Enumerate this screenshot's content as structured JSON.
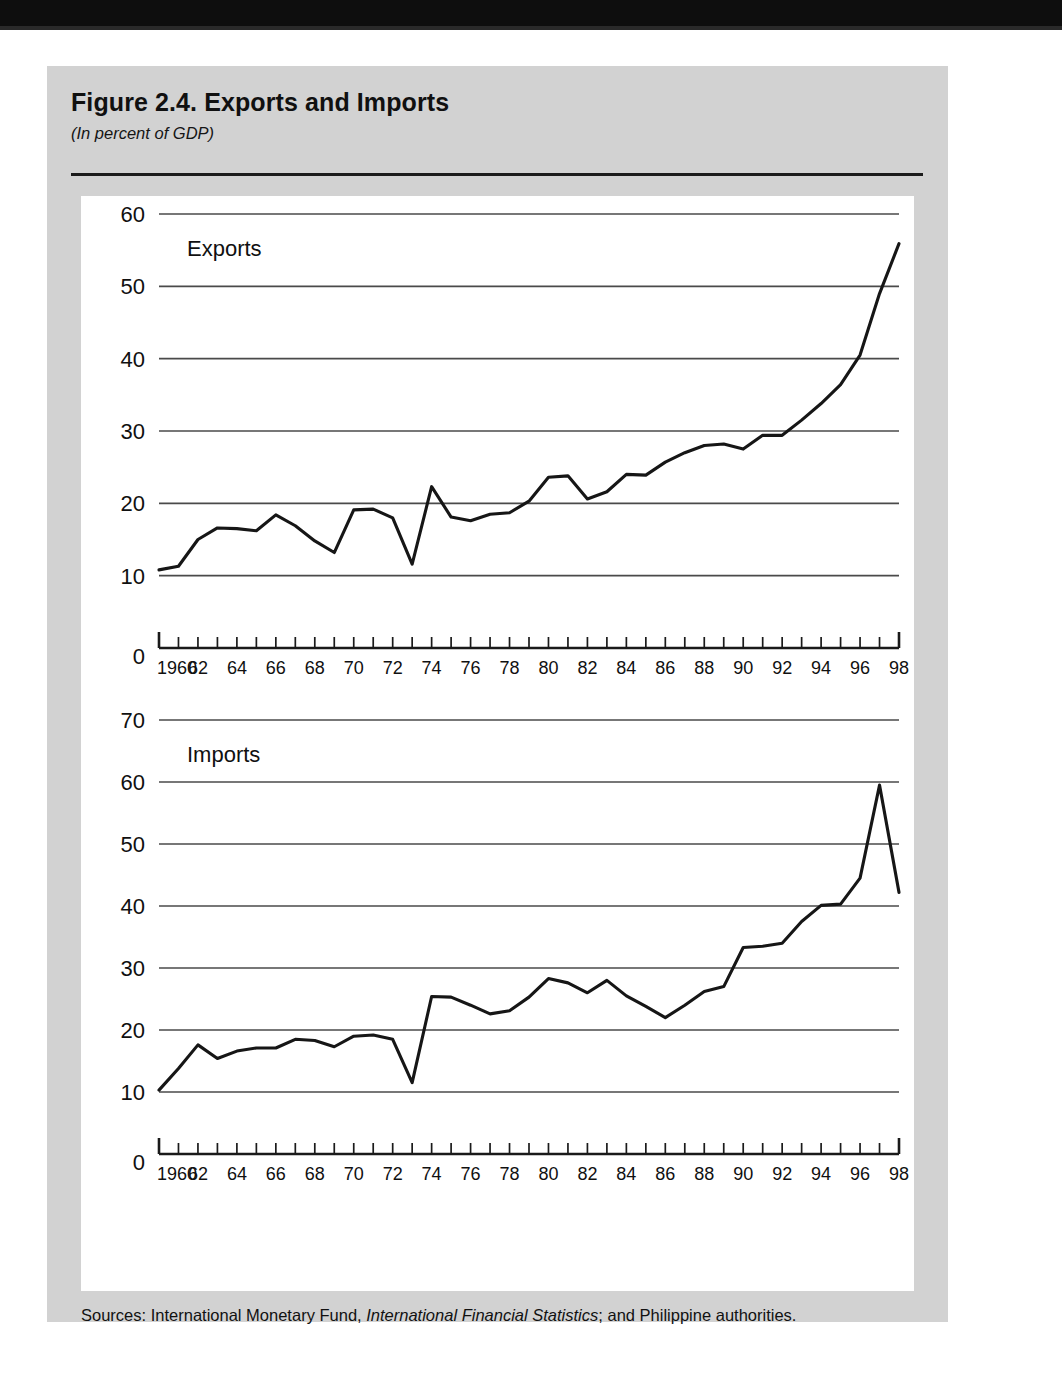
{
  "figure": {
    "title": "Figure 2.4.  Exports and Imports",
    "subtitle": "(In percent of GDP)",
    "source_prefix": "Sources:  International Monetary Fund, ",
    "source_italic": "International Financial Statistics",
    "source_suffix": "; and Philippine authorities."
  },
  "colors": {
    "page_background": "#ffffff",
    "panel_background": "#d2d2d2",
    "plot_background": "#ffffff",
    "line": "#161616",
    "gridline": "#4a4a4a",
    "axis": "#1a1a1a",
    "scan_band": "#0e0e0e"
  },
  "chart_data": [
    {
      "type": "line",
      "title": "Exports",
      "xlabel": "",
      "ylabel": "",
      "ylim": [
        0,
        60
      ],
      "yticks": [
        0,
        10,
        20,
        30,
        40,
        50,
        60
      ],
      "gridlines": [
        10,
        20,
        30,
        40,
        50,
        60
      ],
      "grid": true,
      "legend": "none",
      "xlim": [
        1960,
        1998
      ],
      "xticks": [
        1960,
        1961,
        1962,
        1963,
        1964,
        1965,
        1966,
        1967,
        1968,
        1969,
        1970,
        1971,
        1972,
        1973,
        1974,
        1975,
        1976,
        1977,
        1978,
        1979,
        1980,
        1981,
        1982,
        1983,
        1984,
        1985,
        1986,
        1987,
        1988,
        1989,
        1990,
        1991,
        1992,
        1993,
        1994,
        1995,
        1996,
        1997,
        1998
      ],
      "xticklabels": [
        "1960",
        "62",
        "64",
        "66",
        "68",
        "70",
        "72",
        "74",
        "76",
        "78",
        "80",
        "82",
        "84",
        "86",
        "88",
        "90",
        "92",
        "94",
        "96",
        "98"
      ],
      "x": [
        1960,
        1961,
        1962,
        1963,
        1964,
        1965,
        1966,
        1967,
        1968,
        1969,
        1970,
        1971,
        1972,
        1973,
        1974,
        1975,
        1976,
        1977,
        1978,
        1979,
        1980,
        1981,
        1982,
        1983,
        1984,
        1985,
        1986,
        1987,
        1988,
        1989,
        1990,
        1991,
        1992,
        1993,
        1994,
        1995,
        1996,
        1997,
        1998
      ],
      "values": [
        10.8,
        11.3,
        15.0,
        16.6,
        16.5,
        16.2,
        18.4,
        16.9,
        14.8,
        13.2,
        19.1,
        19.2,
        18.0,
        11.6,
        22.3,
        18.1,
        17.6,
        18.5,
        18.7,
        20.3,
        23.6,
        23.8,
        20.6,
        21.6,
        24.0,
        23.9,
        25.7,
        27.0,
        28.0,
        28.2,
        27.5,
        29.4,
        29.4,
        31.5,
        33.8,
        36.4,
        40.5,
        49.0,
        55.9
      ]
    },
    {
      "type": "line",
      "title": "Imports",
      "xlabel": "",
      "ylabel": "",
      "ylim": [
        0,
        70
      ],
      "yticks": [
        0,
        10,
        20,
        30,
        40,
        50,
        60,
        70
      ],
      "gridlines": [
        10,
        20,
        30,
        40,
        50,
        60,
        70
      ],
      "grid": true,
      "legend": "none",
      "xlim": [
        1960,
        1998
      ],
      "xticks": [
        1960,
        1961,
        1962,
        1963,
        1964,
        1965,
        1966,
        1967,
        1968,
        1969,
        1970,
        1971,
        1972,
        1973,
        1974,
        1975,
        1976,
        1977,
        1978,
        1979,
        1980,
        1981,
        1982,
        1983,
        1984,
        1985,
        1986,
        1987,
        1988,
        1989,
        1990,
        1991,
        1992,
        1993,
        1994,
        1995,
        1996,
        1997,
        1998
      ],
      "xticklabels": [
        "1960",
        "62",
        "64",
        "66",
        "68",
        "70",
        "72",
        "74",
        "76",
        "78",
        "80",
        "82",
        "84",
        "86",
        "88",
        "90",
        "92",
        "94",
        "96",
        "98"
      ],
      "x": [
        1960,
        1961,
        1962,
        1963,
        1964,
        1965,
        1966,
        1967,
        1968,
        1969,
        1970,
        1971,
        1972,
        1973,
        1974,
        1975,
        1976,
        1977,
        1978,
        1979,
        1980,
        1981,
        1982,
        1983,
        1984,
        1985,
        1986,
        1987,
        1988,
        1989,
        1990,
        1991,
        1992,
        1993,
        1994,
        1995,
        1996,
        1997,
        1998
      ],
      "values": [
        10.3,
        13.8,
        17.6,
        15.4,
        16.6,
        17.1,
        17.1,
        18.5,
        18.3,
        17.3,
        19.0,
        19.2,
        18.5,
        11.5,
        25.4,
        25.3,
        24.0,
        22.6,
        23.1,
        25.3,
        28.3,
        27.6,
        26.0,
        28.0,
        25.5,
        23.8,
        22.0,
        24.0,
        26.2,
        27.0,
        33.3,
        33.5,
        34.0,
        37.5,
        40.1,
        40.3,
        44.5,
        59.5,
        42.2
      ]
    }
  ]
}
